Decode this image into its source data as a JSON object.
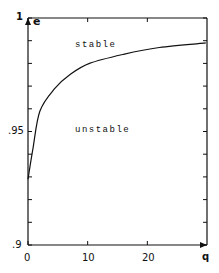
{
  "chart_data": {
    "type": "line",
    "title": "",
    "xlabel": "q",
    "ylabel": "e",
    "xlim": [
      0,
      30
    ],
    "ylim": [
      0.9,
      1.0
    ],
    "x_ticks": [
      0,
      10,
      20
    ],
    "x_tick_labels": [
      "0",
      "10",
      "20"
    ],
    "x_axis_end_label": "q",
    "y_ticks": [
      0.9,
      0.95,
      1.0
    ],
    "y_tick_labels": [
      ".9",
      ".95",
      "1"
    ],
    "y_minor_step": 0.01,
    "grid": false,
    "legend": null,
    "series": [
      {
        "name": "stability boundary",
        "x": [
          0,
          0.8,
          2,
          4.5,
          7,
          10.3,
          16,
          22,
          29.8
        ],
        "y": [
          0.929,
          0.942,
          0.959,
          0.969,
          0.975,
          0.98,
          0.984,
          0.987,
          0.989
        ]
      }
    ],
    "annotations": [
      {
        "text": "stable",
        "x": 12,
        "y": 0.992
      },
      {
        "text": "unstable",
        "x": 12,
        "y": 0.947
      }
    ]
  },
  "labels": {
    "y_top": "1",
    "y_axis_name": "e",
    "y_mid": ".95",
    "y_bottom": ".9",
    "x_0": "0",
    "x_10": "10",
    "x_20": "20",
    "x_end": "q",
    "region_stable": "stable",
    "region_unstable": "unstable"
  },
  "colors": {
    "ink": "#111111",
    "background": "#ffffff"
  }
}
